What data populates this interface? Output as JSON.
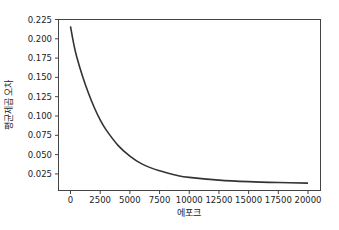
{
  "chart_data": {
    "type": "line",
    "title": "",
    "xlabel": "에포크",
    "ylabel": "평균제곱 오차",
    "xlim": [
      -1000,
      21000
    ],
    "ylim": [
      0.004,
      0.225
    ],
    "xticks": [
      0,
      2500,
      5000,
      7500,
      10000,
      12500,
      15000,
      17500,
      20000
    ],
    "xtick_labels": [
      "0",
      "2500",
      "5000",
      "7500",
      "10000",
      "12500",
      "15000",
      "17500",
      "20000"
    ],
    "yticks": [
      0.025,
      0.05,
      0.075,
      0.1,
      0.125,
      0.15,
      0.175,
      0.2,
      0.225
    ],
    "ytick_labels": [
      "0.025",
      "0.050",
      "0.075",
      "0.100",
      "0.125",
      "0.150",
      "0.175",
      "0.200",
      "0.225"
    ],
    "grid": false,
    "legend": null,
    "series": [
      {
        "name": "mse",
        "color": "#333333",
        "x": [
          0,
          250,
          500,
          1000,
          1500,
          2000,
          2500,
          3000,
          4000,
          5000,
          6000,
          7500,
          9000,
          10000,
          12500,
          15000,
          17500,
          20000
        ],
        "y": [
          0.216,
          0.195,
          0.178,
          0.152,
          0.13,
          0.111,
          0.095,
          0.082,
          0.062,
          0.048,
          0.038,
          0.029,
          0.023,
          0.0205,
          0.017,
          0.015,
          0.0138,
          0.013
        ]
      }
    ]
  }
}
